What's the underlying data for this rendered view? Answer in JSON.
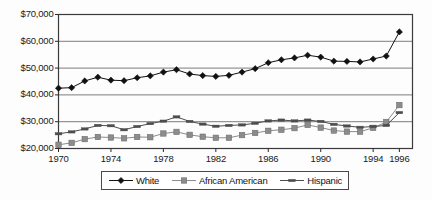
{
  "chart_data": {
    "type": "line",
    "title": "",
    "subtitle": "",
    "xlabel": "",
    "ylabel": "",
    "xlim": [
      1970,
      1997
    ],
    "ylim": [
      20000,
      70000
    ],
    "grid": true,
    "legend_position": "bottom",
    "x": [
      1970,
      1971,
      1972,
      1973,
      1974,
      1975,
      1976,
      1977,
      1978,
      1979,
      1980,
      1981,
      1982,
      1983,
      1984,
      1985,
      1986,
      1987,
      1988,
      1989,
      1990,
      1991,
      1992,
      1993,
      1994,
      1995,
      1996
    ],
    "x_ticks": [
      1970,
      1974,
      1978,
      1982,
      1986,
      1990,
      1994,
      1996
    ],
    "x_tick_labels": [
      "1970",
      "1974",
      "1978",
      "1982",
      "1986",
      "1990",
      "1994",
      "1996"
    ],
    "y_ticks": [
      20000,
      30000,
      40000,
      50000,
      60000,
      70000
    ],
    "y_tick_labels": [
      "$20,000",
      "$30,000",
      "$40,000",
      "$50,000",
      "$60,000",
      "$70,000"
    ],
    "series": [
      {
        "name": "White",
        "marker": "diamond",
        "color": "#111111",
        "values": [
          42500,
          42700,
          45200,
          46600,
          45500,
          45300,
          46400,
          47100,
          48500,
          49400,
          47800,
          47200,
          46900,
          47300,
          48500,
          49800,
          52000,
          53100,
          53800,
          54800,
          54100,
          52600,
          52500,
          52300,
          53400,
          54500,
          56000
        ]
      },
      {
        "name": "African American",
        "marker": "square",
        "color": "#8c8c8c",
        "values": [
          21400,
          22100,
          23500,
          24300,
          24100,
          23800,
          24300,
          24200,
          25600,
          26200,
          25100,
          24400,
          24000,
          24000,
          25000,
          25800,
          26600,
          27000,
          27600,
          28800,
          27800,
          26700,
          26300,
          26300,
          27700,
          29900,
          31300
        ]
      },
      {
        "name": "Hispanic",
        "marker": "dash",
        "color": "#4d4d4d",
        "values": [
          25500,
          26200,
          27300,
          28600,
          28500,
          27000,
          28200,
          29300,
          30200,
          31800,
          30100,
          29100,
          28300,
          28600,
          28800,
          29400,
          30300,
          30600,
          30300,
          30600,
          30100,
          29000,
          28400,
          27900,
          28200,
          28600,
          29800
        ]
      }
    ],
    "note_actual_renders": "Series are plotted from the values above; 1996 endpoints: White ~63,500; African American ~36,200; Hispanic ~33,400"
  },
  "legend": {
    "items": [
      {
        "label": "White",
        "marker": "diamond"
      },
      {
        "label": "African American",
        "marker": "square"
      },
      {
        "label": "Hispanic",
        "marker": "dash"
      }
    ]
  }
}
